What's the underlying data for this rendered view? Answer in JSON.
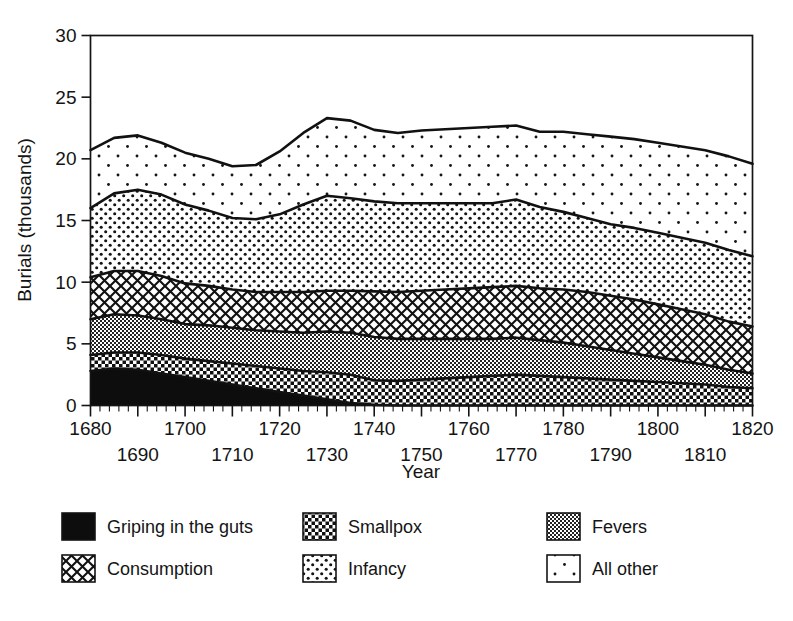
{
  "chart_data": {
    "type": "area",
    "title": "",
    "xlabel": "Year",
    "ylabel": "Burials (thousands)",
    "xlim": [
      1680,
      1820
    ],
    "ylim": [
      0,
      30
    ],
    "yticks": [
      0,
      5,
      10,
      15,
      20,
      25,
      30
    ],
    "xticks_upper_row": [
      1680,
      1700,
      1720,
      1740,
      1760,
      1780,
      1800,
      1820
    ],
    "xticks_lower_row": [
      1690,
      1710,
      1730,
      1750,
      1770,
      1790,
      1810
    ],
    "xtick_minor_step": 2,
    "grid": false,
    "stacked": true,
    "legend_position": "bottom",
    "x": [
      1680,
      1685,
      1690,
      1695,
      1700,
      1705,
      1710,
      1715,
      1720,
      1725,
      1730,
      1735,
      1740,
      1745,
      1750,
      1755,
      1760,
      1765,
      1770,
      1775,
      1780,
      1785,
      1790,
      1795,
      1800,
      1805,
      1810,
      1815,
      1820
    ],
    "series": [
      {
        "name": "Griping in the guts",
        "fill": "solid-black",
        "values": [
          2.8,
          3.0,
          2.9,
          2.6,
          2.3,
          2.0,
          1.7,
          1.4,
          1.1,
          0.8,
          0.5,
          0.2,
          0.05,
          0.0,
          0.0,
          0.0,
          0.0,
          0.0,
          0.0,
          0.0,
          0.0,
          0.0,
          0.0,
          0.0,
          0.0,
          0.0,
          0.0,
          0.0,
          0.0
        ]
      },
      {
        "name": "Smallpox",
        "fill": "checkerboard",
        "values": [
          1.3,
          1.3,
          1.4,
          1.5,
          1.5,
          1.6,
          1.7,
          1.8,
          1.9,
          2.0,
          2.2,
          2.3,
          2.0,
          2.0,
          2.1,
          2.2,
          2.3,
          2.4,
          2.5,
          2.4,
          2.3,
          2.2,
          2.1,
          2.0,
          1.9,
          1.8,
          1.7,
          1.5,
          1.4
        ]
      },
      {
        "name": "Fevers",
        "fill": "gray-stipple",
        "values": [
          2.9,
          3.1,
          3.0,
          2.9,
          2.8,
          2.9,
          2.9,
          2.9,
          3.0,
          3.1,
          3.3,
          3.4,
          3.5,
          3.4,
          3.3,
          3.2,
          3.1,
          3.0,
          3.0,
          2.9,
          2.8,
          2.6,
          2.4,
          2.2,
          2.0,
          1.8,
          1.6,
          1.4,
          1.2
        ]
      },
      {
        "name": "Consumption",
        "fill": "diamond-hatch",
        "values": [
          3.4,
          3.5,
          3.6,
          3.5,
          3.3,
          3.2,
          3.1,
          3.1,
          3.2,
          3.3,
          3.3,
          3.4,
          3.7,
          3.8,
          3.9,
          4.0,
          4.1,
          4.2,
          4.2,
          4.2,
          4.3,
          4.4,
          4.4,
          4.4,
          4.3,
          4.2,
          4.1,
          3.9,
          3.8
        ]
      },
      {
        "name": "Infancy",
        "fill": "dense-dots",
        "values": [
          5.6,
          6.3,
          6.6,
          6.6,
          6.4,
          6.1,
          5.8,
          5.9,
          6.3,
          7.1,
          7.7,
          7.5,
          7.3,
          7.2,
          7.1,
          7.0,
          6.9,
          6.8,
          7.0,
          6.6,
          6.3,
          6.0,
          5.8,
          5.8,
          5.8,
          5.8,
          5.8,
          5.8,
          5.7
        ]
      },
      {
        "name": "All other",
        "fill": "sparse-dots",
        "values": [
          4.7,
          4.5,
          4.4,
          4.2,
          4.2,
          4.2,
          4.2,
          4.4,
          5.1,
          5.8,
          6.3,
          6.3,
          5.8,
          5.7,
          5.9,
          6.0,
          6.1,
          6.2,
          6.0,
          6.1,
          6.5,
          6.8,
          7.1,
          7.2,
          7.3,
          7.4,
          7.5,
          7.6,
          7.5
        ]
      }
    ],
    "totals": [
      20.7,
      21.7,
      21.9,
      21.3,
      20.5,
      20.0,
      19.4,
      19.5,
      20.6,
      22.1,
      23.3,
      23.1,
      22.35,
      22.1,
      22.3,
      22.4,
      22.5,
      22.6,
      22.7,
      22.2,
      22.2,
      22.0,
      21.8,
      21.6,
      21.3,
      21.0,
      20.7,
      20.2,
      19.6
    ]
  },
  "legend": {
    "items": [
      {
        "label": "Griping in the guts",
        "swatch": "solid-black"
      },
      {
        "label": "Smallpox",
        "swatch": "checkerboard"
      },
      {
        "label": "Fevers",
        "swatch": "gray-stipple"
      },
      {
        "label": "Consumption",
        "swatch": "diamond-hatch"
      },
      {
        "label": "Infancy",
        "swatch": "dense-dots"
      },
      {
        "label": "All other",
        "swatch": "sparse-dots"
      }
    ]
  }
}
